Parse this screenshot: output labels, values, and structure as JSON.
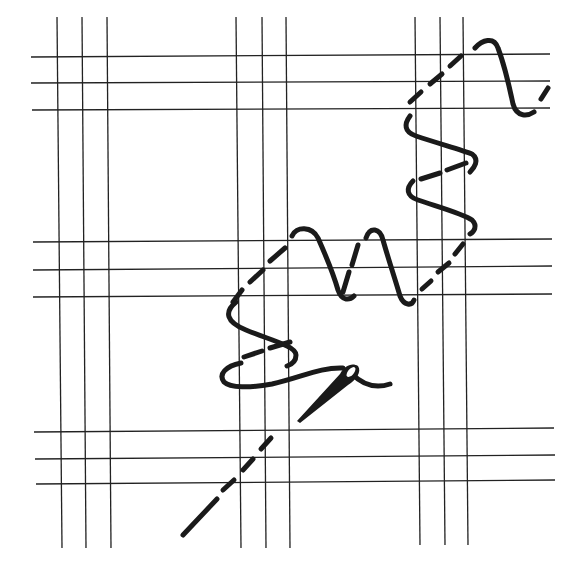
{
  "figure": {
    "caption_clipped": true,
    "colors": {
      "background": "#ffffff",
      "ink": "#1a1a1a",
      "grid": "#222222"
    }
  },
  "grid": {
    "vertical_groups": [
      {
        "name": "left",
        "x": [
          57,
          83,
          108
        ]
      },
      {
        "name": "middle",
        "x": [
          237,
          263,
          287
        ]
      },
      {
        "name": "right",
        "x": [
          416,
          440,
          464
        ]
      }
    ],
    "horizontal_groups": [
      {
        "name": "top",
        "y": [
          57,
          83,
          110
        ]
      },
      {
        "name": "middle",
        "y": [
          242,
          269,
          296
        ]
      },
      {
        "name": "bottom",
        "y": [
          431,
          458,
          484
        ]
      }
    ],
    "vertical_extent": [
      17,
      548
    ],
    "horizontal_extent": [
      32,
      553
    ]
  },
  "elements": {
    "needle": "needle-icon",
    "thread": "thread-stitch",
    "back_stitches": "dashed-underside-stitches"
  }
}
